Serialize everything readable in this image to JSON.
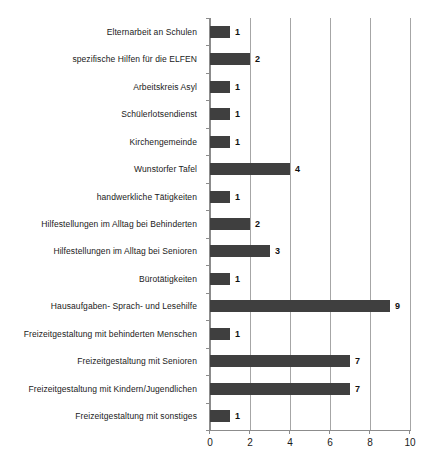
{
  "chart_data": {
    "type": "bar",
    "orientation": "horizontal",
    "title": "",
    "xlabel": "",
    "ylabel": "",
    "xlim": [
      0,
      10
    ],
    "xticks": [
      0,
      2,
      4,
      6,
      8,
      10
    ],
    "xtick_labels": [
      "0",
      "2",
      "4",
      "6",
      "8",
      "10"
    ],
    "grid": true,
    "grid_axis": "x",
    "legend": false,
    "bar_color": "#3f3f3f",
    "show_value_labels": true,
    "categories": [
      "Elternarbeit an Schulen",
      "spezifische Hilfen für die ELFEN",
      "Arbeitskreis Asyl",
      "Schülerlotsendienst",
      "Kirchengemeinde",
      "Wunstorfer Tafel",
      "handwerkliche Tätigkeiten",
      "Hilfestellungen im Alltag bei Behinderten",
      "Hilfestellungen im Alltag bei Senioren",
      "Bürotätigkeiten",
      "Hausaufgaben- Sprach- und Lesehilfe",
      "Freizeitgestaltung mit behinderten Menschen",
      "Freizeitgestaltung mit Senioren",
      "Freizeitgestaltung mit Kindern/Jugendlichen",
      "Freizeitgestaltung mit sonstiges"
    ],
    "values": [
      1,
      2,
      1,
      1,
      1,
      4,
      1,
      2,
      3,
      1,
      9,
      1,
      7,
      7,
      1
    ],
    "value_labels": [
      "1",
      "2",
      "1",
      "1",
      "1",
      "4",
      "1",
      "2",
      "3",
      "1",
      "9",
      "1",
      "7",
      "7",
      "1"
    ]
  }
}
